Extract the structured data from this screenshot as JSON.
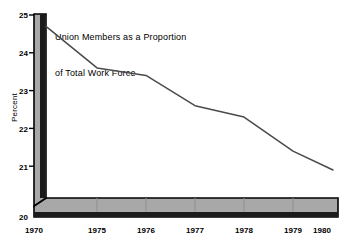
{
  "chart_data": {
    "type": "line",
    "title": "Union Members as a Proportion\nof Total Work Force",
    "title_line1": "Union Members as a Proportion",
    "title_line2": "of Total Work Force",
    "xlabel": "",
    "ylabel": "Percent",
    "categories": [
      "1970",
      "1975",
      "1976",
      "1977",
      "1978",
      "1979",
      "1980"
    ],
    "values": [
      24.7,
      23.6,
      23.4,
      22.6,
      22.3,
      21.4,
      20.9
    ],
    "series": [
      {
        "name": "Union Members as a Proportion of Total Work Force",
        "values": [
          24.7,
          23.6,
          23.4,
          22.6,
          22.3,
          21.4,
          20.9
        ]
      }
    ],
    "ylim": [
      20,
      25
    ],
    "ytick_labels": [
      "25",
      "24",
      "23",
      "22",
      "21",
      "20"
    ],
    "ytick_values": [
      25,
      24,
      23,
      22,
      21,
      20
    ],
    "xtick_labels": [
      "1970",
      "1975",
      "1976",
      "1977",
      "1978",
      "1979",
      "1980"
    ],
    "grid": false,
    "legend": "none",
    "style": "pseudo-3d-axis",
    "colors": {
      "line": "#4a4a4a",
      "axis_block": "#a8a8a8",
      "axis_edge": "#000000",
      "background": "#ffffff",
      "text": "#000000"
    }
  },
  "axes": {
    "y_ticks": [
      {
        "label": "25",
        "value": 25
      },
      {
        "label": "24",
        "value": 24
      },
      {
        "label": "23",
        "value": 23
      },
      {
        "label": "22",
        "value": 22
      },
      {
        "label": "21",
        "value": 21
      },
      {
        "label": "20",
        "value": 20
      }
    ],
    "x_ticks": [
      {
        "label": "1970"
      },
      {
        "label": "1975"
      },
      {
        "label": "1976"
      },
      {
        "label": "1977"
      },
      {
        "label": "1978"
      },
      {
        "label": "1979"
      },
      {
        "label": "1980"
      }
    ],
    "y_axis_title": "Percent"
  }
}
